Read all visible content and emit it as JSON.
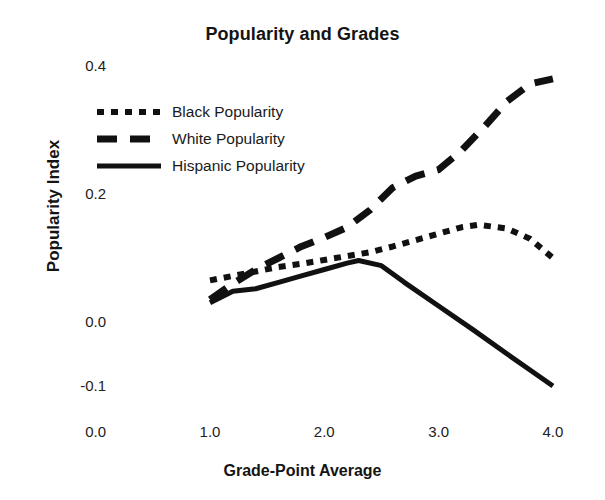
{
  "chart_data": {
    "type": "line",
    "title": "Popularity and Grades",
    "xlabel": "Grade-Point Average",
    "ylabel": "Popularity Index",
    "xlim": [
      0.0,
      4.0
    ],
    "ylim": [
      -0.1,
      0.4
    ],
    "grid": false,
    "legend_position": "upper-left-inside",
    "x_ticks": [
      "0.0",
      "1.0",
      "2.0",
      "3.0",
      "4.0"
    ],
    "x_tick_values": [
      0.0,
      1.0,
      2.0,
      3.0,
      4.0
    ],
    "y_ticks": [
      "0.4",
      "0.2",
      "0.0",
      "-0.1"
    ],
    "y_tick_values": [
      0.4,
      0.2,
      0.0,
      -0.1
    ],
    "series": [
      {
        "name": "Black Popularity",
        "style": "dotted",
        "color": "#111111",
        "x": [
          1.0,
          1.2,
          1.4,
          1.6,
          1.8,
          2.0,
          2.2,
          2.4,
          2.6,
          2.8,
          3.0,
          3.2,
          3.35,
          3.6,
          3.8,
          4.0
        ],
        "values": [
          0.065,
          0.072,
          0.079,
          0.086,
          0.091,
          0.097,
          0.103,
          0.109,
          0.118,
          0.128,
          0.138,
          0.148,
          0.152,
          0.146,
          0.13,
          0.1
        ]
      },
      {
        "name": "White Popularity",
        "style": "dashed",
        "color": "#111111",
        "x": [
          1.0,
          1.2,
          1.4,
          1.6,
          1.8,
          2.0,
          2.2,
          2.4,
          2.6,
          2.8,
          3.0,
          3.2,
          3.4,
          3.6,
          3.8,
          4.0
        ],
        "values": [
          0.035,
          0.06,
          0.082,
          0.1,
          0.118,
          0.132,
          0.148,
          0.175,
          0.21,
          0.228,
          0.238,
          0.268,
          0.305,
          0.345,
          0.372,
          0.38
        ]
      },
      {
        "name": "Hispanic Popularity",
        "style": "solid",
        "color": "#111111",
        "x": [
          1.0,
          1.2,
          1.4,
          1.6,
          1.8,
          2.0,
          2.2,
          2.3,
          2.5,
          2.7,
          3.0,
          3.3,
          3.6,
          3.8,
          4.0
        ],
        "values": [
          0.03,
          0.048,
          0.052,
          0.062,
          0.072,
          0.082,
          0.092,
          0.096,
          0.088,
          0.062,
          0.025,
          -0.012,
          -0.05,
          -0.075,
          -0.1
        ]
      }
    ]
  },
  "axes": {
    "y_title": "Popularity Index",
    "x_title": "Grade-Point Average"
  },
  "legend": {
    "items": [
      {
        "label": "Black Popularity",
        "style": "dotted"
      },
      {
        "label": "White Popularity",
        "style": "dashed"
      },
      {
        "label": "Hispanic Popularity",
        "style": "solid"
      }
    ]
  }
}
